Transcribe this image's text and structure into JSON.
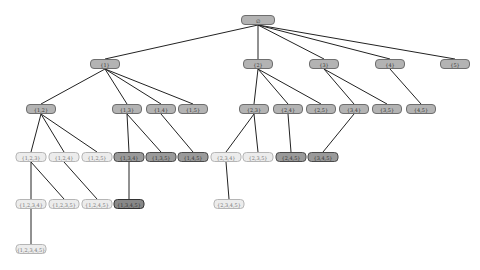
{
  "diagram": {
    "type": "subset-lattice-tree",
    "nodes": [
      {
        "id": "root",
        "label": "∅",
        "x": 258,
        "y": 20,
        "w": 34,
        "style": "mid"
      },
      {
        "id": "1",
        "label": "{1}",
        "x": 105,
        "y": 64,
        "w": 30,
        "style": "mid"
      },
      {
        "id": "2",
        "label": "{2}",
        "x": 258,
        "y": 64,
        "w": 30,
        "style": "mid"
      },
      {
        "id": "3",
        "label": "{3}",
        "x": 324,
        "y": 64,
        "w": 30,
        "style": "mid"
      },
      {
        "id": "4",
        "label": "{4}",
        "x": 390,
        "y": 64,
        "w": 30,
        "style": "mid"
      },
      {
        "id": "5",
        "label": "{5}",
        "x": 455,
        "y": 64,
        "w": 30,
        "style": "mid"
      },
      {
        "id": "12",
        "label": "{1,2}",
        "x": 41,
        "y": 109,
        "w": 30,
        "style": "mid"
      },
      {
        "id": "13",
        "label": "{1,3}",
        "x": 127,
        "y": 109,
        "w": 30,
        "style": "mid"
      },
      {
        "id": "14",
        "label": "{1,4}",
        "x": 161,
        "y": 109,
        "w": 30,
        "style": "mid"
      },
      {
        "id": "15",
        "label": "{1,5}",
        "x": 193,
        "y": 109,
        "w": 30,
        "style": "mid"
      },
      {
        "id": "23",
        "label": "{2,3}",
        "x": 254,
        "y": 109,
        "w": 30,
        "style": "mid"
      },
      {
        "id": "24",
        "label": "{2,4}",
        "x": 288,
        "y": 109,
        "w": 30,
        "style": "mid"
      },
      {
        "id": "25",
        "label": "{2,5}",
        "x": 321,
        "y": 109,
        "w": 30,
        "style": "mid"
      },
      {
        "id": "34",
        "label": "{3,4}",
        "x": 354,
        "y": 109,
        "w": 30,
        "style": "mid"
      },
      {
        "id": "35",
        "label": "{3,5}",
        "x": 387,
        "y": 109,
        "w": 30,
        "style": "mid"
      },
      {
        "id": "45",
        "label": "{4,5}",
        "x": 421,
        "y": 109,
        "w": 30,
        "style": "mid"
      },
      {
        "id": "123",
        "label": "{1,2,3}",
        "x": 31,
        "y": 157,
        "w": 31,
        "style": "light"
      },
      {
        "id": "124",
        "label": "{1,2,4}",
        "x": 64,
        "y": 157,
        "w": 31,
        "style": "light"
      },
      {
        "id": "125",
        "label": "{1,2,5}",
        "x": 97,
        "y": 157,
        "w": 31,
        "style": "light"
      },
      {
        "id": "134",
        "label": "{1,3,4}",
        "x": 129,
        "y": 157,
        "w": 31,
        "style": "dark"
      },
      {
        "id": "135",
        "label": "{1,3,5}",
        "x": 161,
        "y": 157,
        "w": 31,
        "style": "dark"
      },
      {
        "id": "145",
        "label": "{1,4,5}",
        "x": 193,
        "y": 157,
        "w": 31,
        "style": "dark"
      },
      {
        "id": "234",
        "label": "{2,3,4}",
        "x": 226,
        "y": 157,
        "w": 31,
        "style": "light"
      },
      {
        "id": "235",
        "label": "{2,3,5}",
        "x": 258,
        "y": 157,
        "w": 31,
        "style": "light"
      },
      {
        "id": "245",
        "label": "{2,4,5}",
        "x": 291,
        "y": 157,
        "w": 31,
        "style": "dark"
      },
      {
        "id": "345",
        "label": "{3,4,5}",
        "x": 323,
        "y": 157,
        "w": 31,
        "style": "dark"
      },
      {
        "id": "1234",
        "label": "{1,2,3,4}",
        "x": 31,
        "y": 204,
        "w": 31,
        "style": "light"
      },
      {
        "id": "1235",
        "label": "{1,2,3,5}",
        "x": 64,
        "y": 204,
        "w": 31,
        "style": "light"
      },
      {
        "id": "1245",
        "label": "{1,2,4,5}",
        "x": 97,
        "y": 204,
        "w": 31,
        "style": "light"
      },
      {
        "id": "1345",
        "label": "{1,3,4,5}",
        "x": 129,
        "y": 204,
        "w": 31,
        "style": "darkest"
      },
      {
        "id": "2345",
        "label": "{2,3,4,5}",
        "x": 229,
        "y": 204,
        "w": 31,
        "style": "light"
      },
      {
        "id": "12345",
        "label": "{1,2,3,4,5}",
        "x": 31,
        "y": 249,
        "w": 31,
        "style": "light"
      }
    ],
    "edges": [
      [
        "root",
        "1"
      ],
      [
        "root",
        "2"
      ],
      [
        "root",
        "3"
      ],
      [
        "root",
        "4"
      ],
      [
        "root",
        "5"
      ],
      [
        "1",
        "12"
      ],
      [
        "1",
        "13"
      ],
      [
        "1",
        "14"
      ],
      [
        "1",
        "15"
      ],
      [
        "2",
        "23"
      ],
      [
        "2",
        "24"
      ],
      [
        "2",
        "25"
      ],
      [
        "3",
        "34"
      ],
      [
        "3",
        "35"
      ],
      [
        "4",
        "45"
      ],
      [
        "12",
        "123"
      ],
      [
        "12",
        "124"
      ],
      [
        "12",
        "125"
      ],
      [
        "13",
        "134"
      ],
      [
        "13",
        "135"
      ],
      [
        "14",
        "145"
      ],
      [
        "23",
        "234"
      ],
      [
        "23",
        "235"
      ],
      [
        "24",
        "245"
      ],
      [
        "34",
        "345"
      ],
      [
        "123",
        "1234"
      ],
      [
        "123",
        "1235"
      ],
      [
        "124",
        "1245"
      ],
      [
        "134",
        "1345"
      ],
      [
        "234",
        "2345"
      ],
      [
        "1234",
        "12345"
      ]
    ]
  }
}
